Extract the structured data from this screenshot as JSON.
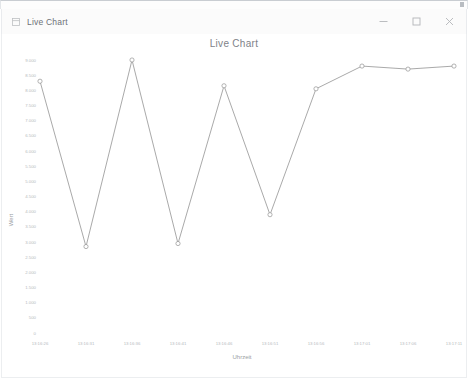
{
  "window": {
    "title": "Live Chart",
    "icon": "app-window-icon",
    "controls": {
      "minimize": "minimize-icon",
      "maximize": "maximize-icon",
      "close": "close-icon"
    }
  },
  "chart_data": {
    "type": "line",
    "title": "Live Chart",
    "xlabel": "Uhrzeit",
    "ylabel": "Wert",
    "grid": false,
    "legend": null,
    "line_color": "#9a9a9a",
    "marker": "circle-open",
    "ylim": [
      0,
      9000
    ],
    "ytick_step": 500,
    "ytick_labels": [
      "9.000",
      "8.500",
      "8.000",
      "7.500",
      "7.000",
      "6.500",
      "6.000",
      "5.500",
      "5.000",
      "4.500",
      "4.000",
      "3.500",
      "3.000",
      "2.500",
      "2.000",
      "1.500",
      "1.000",
      "500",
      "0"
    ],
    "ytick_values": [
      9000,
      8500,
      8000,
      7500,
      7000,
      6500,
      6000,
      5500,
      5000,
      4500,
      4000,
      3500,
      3000,
      2500,
      2000,
      1500,
      1000,
      500,
      0
    ],
    "categories": [
      "13:16:26",
      "13:16:31",
      "13:16:36",
      "13:16:41",
      "13:16:46",
      "13:16:51",
      "13:16:56",
      "13:17:01",
      "13:17:06",
      "13:17:11"
    ],
    "values": [
      8300,
      2850,
      9000,
      2950,
      8150,
      3900,
      8050,
      8800,
      8700,
      8800
    ]
  }
}
